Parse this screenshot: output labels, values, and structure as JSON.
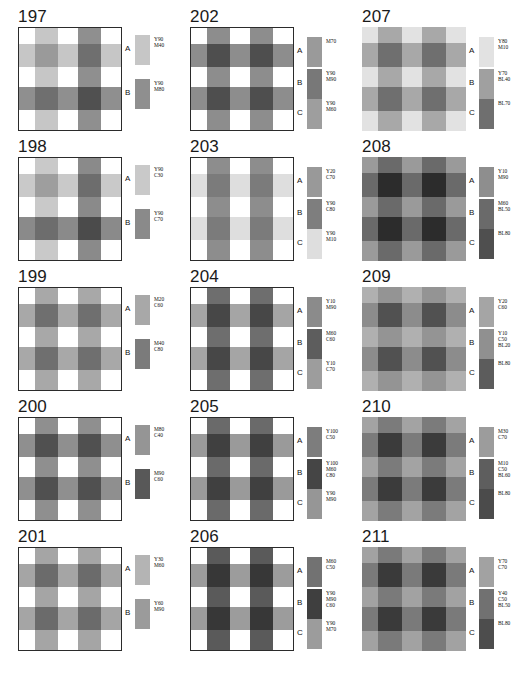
{
  "sheet": {
    "title": "Gingham / check fabric colour pattern plates 197-211",
    "columns": 3,
    "rows": 5
  },
  "plates": [
    {
      "number": "197",
      "bordered": true,
      "axis_labels": [
        "A",
        "B"
      ],
      "legend": [
        {
          "key": "A",
          "color": "#c6c6c6",
          "lines": [
            "Y90",
            "M40"
          ]
        },
        {
          "key": "B",
          "color": "#8f8f8f",
          "lines": [
            "Y90",
            "M80"
          ]
        }
      ],
      "base": "#ffffff",
      "stripes": [
        "#ffffff",
        "#c6c6c6",
        "#ffffff",
        "#8f8f8f",
        "#ffffff"
      ],
      "bands": [
        "#ffffff",
        "#c6c6c6",
        "#ffffff",
        "#8f8f8f",
        "#ffffff"
      ]
    },
    {
      "number": "202",
      "bordered": true,
      "axis_labels": [
        "A",
        "B",
        "C"
      ],
      "legend": [
        {
          "key": "A",
          "color": "#9a9a9a",
          "lines": [
            "M70"
          ]
        },
        {
          "key": "B",
          "color": "#787878",
          "lines": [
            "Y90",
            "M90"
          ]
        },
        {
          "key": "C",
          "color": "#9e9e9e",
          "lines": [
            "Y90",
            "M60"
          ]
        }
      ],
      "base": "#ffffff",
      "stripes": [
        "#ffffff",
        "#8d8d8d",
        "#ffffff",
        "#8d8d8d",
        "#ffffff"
      ],
      "bands": [
        "#ffffff",
        "#8d8d8d",
        "#ffffff",
        "#8d8d8d",
        "#ffffff"
      ]
    },
    {
      "number": "207",
      "bordered": false,
      "axis_labels": [
        "A",
        "B",
        "C"
      ],
      "legend": [
        {
          "key": "A",
          "color": "#e2e2e2",
          "lines": [
            "Y80",
            "M10"
          ]
        },
        {
          "key": "B",
          "color": "#a0a0a0",
          "lines": [
            "Y70",
            "BL40"
          ]
        },
        {
          "key": "C",
          "color": "#6f6f6f",
          "lines": [
            "BL70"
          ]
        }
      ],
      "base": "#e2e2e2",
      "stripes": [
        "#e2e2e2",
        "#a8a8a8",
        "#e2e2e2",
        "#a8a8a8",
        "#e2e2e2"
      ],
      "bands": [
        "#e2e2e2",
        "#a8a8a8",
        "#e2e2e2",
        "#a8a8a8",
        "#e2e2e2"
      ]
    },
    {
      "number": "198",
      "bordered": true,
      "axis_labels": [
        "A",
        "B"
      ],
      "legend": [
        {
          "key": "A",
          "color": "#c9c9c9",
          "lines": [
            "Y90",
            "C30"
          ]
        },
        {
          "key": "B",
          "color": "#8a8a8a",
          "lines": [
            "Y90",
            "C70"
          ]
        }
      ],
      "base": "#ffffff",
      "stripes": [
        "#ffffff",
        "#c9c9c9",
        "#ffffff",
        "#8a8a8a",
        "#ffffff"
      ],
      "bands": [
        "#ffffff",
        "#c9c9c9",
        "#ffffff",
        "#8a8a8a",
        "#ffffff"
      ]
    },
    {
      "number": "203",
      "bordered": true,
      "axis_labels": [
        "A",
        "B",
        "C"
      ],
      "legend": [
        {
          "key": "A",
          "color": "#999999",
          "lines": [
            "Y20",
            "C70"
          ]
        },
        {
          "key": "B",
          "color": "#7e7e7e",
          "lines": [
            "Y90",
            "C80"
          ]
        },
        {
          "key": "C",
          "color": "#dedede",
          "lines": [
            "Y90",
            "M10"
          ]
        }
      ],
      "base": "#ffffff",
      "stripes": [
        "#ffffff",
        "#8d8d8d",
        "#ffffff",
        "#8d8d8d",
        "#ffffff"
      ],
      "bands": [
        "#ffffff",
        "#dedede",
        "#ffffff",
        "#dedede",
        "#ffffff"
      ]
    },
    {
      "number": "208",
      "bordered": false,
      "axis_labels": [
        "A",
        "B",
        "C"
      ],
      "legend": [
        {
          "key": "A",
          "color": "#8e8e8e",
          "lines": [
            "Y10",
            "M90"
          ]
        },
        {
          "key": "B",
          "color": "#6a6a6a",
          "lines": [
            "M60",
            "BL50"
          ]
        },
        {
          "key": "C",
          "color": "#4f4f4f",
          "lines": [
            "BL80"
          ]
        }
      ],
      "base": "#9a9a9a",
      "stripes": [
        "#9a9a9a",
        "#6a6a6a",
        "#9a9a9a",
        "#6a6a6a",
        "#9a9a9a"
      ],
      "bands": [
        "#9a9a9a",
        "#6a6a6a",
        "#9a9a9a",
        "#6a6a6a",
        "#9a9a9a"
      ]
    },
    {
      "number": "199",
      "bordered": true,
      "axis_labels": [
        "A",
        "B"
      ],
      "legend": [
        {
          "key": "A",
          "color": "#a8a8a8",
          "lines": [
            "M20",
            "C60"
          ]
        },
        {
          "key": "B",
          "color": "#7b7b7b",
          "lines": [
            "M40",
            "C80"
          ]
        }
      ],
      "base": "#ffffff",
      "stripes": [
        "#ffffff",
        "#a8a8a8",
        "#ffffff",
        "#a8a8a8",
        "#ffffff"
      ],
      "bands": [
        "#ffffff",
        "#a8a8a8",
        "#ffffff",
        "#a8a8a8",
        "#ffffff"
      ]
    },
    {
      "number": "204",
      "bordered": true,
      "axis_labels": [
        "A",
        "B",
        "C"
      ],
      "legend": [
        {
          "key": "A",
          "color": "#8b8b8b",
          "lines": [
            "Y10",
            "M90"
          ]
        },
        {
          "key": "B",
          "color": "#5d5d5d",
          "lines": [
            "M60",
            "C60"
          ]
        },
        {
          "key": "C",
          "color": "#9d9d9d",
          "lines": [
            "Y10",
            "C70"
          ]
        }
      ],
      "base": "#ffffff",
      "stripes": [
        "#ffffff",
        "#6e6e6e",
        "#ffffff",
        "#6e6e6e",
        "#ffffff"
      ],
      "bands": [
        "#ffffff",
        "#a5a5a5",
        "#ffffff",
        "#a5a5a5",
        "#ffffff"
      ]
    },
    {
      "number": "209",
      "bordered": false,
      "axis_labels": [
        "A",
        "B",
        "C"
      ],
      "legend": [
        {
          "key": "A",
          "color": "#a5a5a5",
          "lines": [
            "Y20",
            "C60"
          ]
        },
        {
          "key": "B",
          "color": "#909090",
          "lines": [
            "Y10",
            "C50",
            "BL20"
          ]
        },
        {
          "key": "C",
          "color": "#5c5c5c",
          "lines": [
            "BL80"
          ]
        }
      ],
      "base": "#b0b0b0",
      "stripes": [
        "#b0b0b0",
        "#949494",
        "#b0b0b0",
        "#949494",
        "#b0b0b0"
      ],
      "bands": [
        "#b0b0b0",
        "#8c8c8c",
        "#b0b0b0",
        "#8c8c8c",
        "#b0b0b0"
      ]
    },
    {
      "number": "200",
      "bordered": true,
      "axis_labels": [
        "A",
        "B"
      ],
      "legend": [
        {
          "key": "A",
          "color": "#959595",
          "lines": [
            "M80",
            "C40"
          ]
        },
        {
          "key": "B",
          "color": "#585858",
          "lines": [
            "M90",
            "C60"
          ]
        }
      ],
      "base": "#ffffff",
      "stripes": [
        "#ffffff",
        "#8f8f8f",
        "#ffffff",
        "#8f8f8f",
        "#ffffff"
      ],
      "bands": [
        "#ffffff",
        "#8f8f8f",
        "#ffffff",
        "#8f8f8f",
        "#ffffff"
      ]
    },
    {
      "number": "205",
      "bordered": true,
      "axis_labels": [
        "A",
        "B",
        "C"
      ],
      "legend": [
        {
          "key": "A",
          "color": "#7d7d7d",
          "lines": [
            "Y100",
            "C50"
          ]
        },
        {
          "key": "B",
          "color": "#454545",
          "lines": [
            "Y100",
            "M60",
            "C80"
          ]
        },
        {
          "key": "C",
          "color": "#969696",
          "lines": [
            "Y90",
            "M90"
          ]
        }
      ],
      "base": "#ffffff",
      "stripes": [
        "#ffffff",
        "#6a6a6a",
        "#ffffff",
        "#6a6a6a",
        "#ffffff"
      ],
      "bands": [
        "#ffffff",
        "#9a9a9a",
        "#ffffff",
        "#9a9a9a",
        "#ffffff"
      ]
    },
    {
      "number": "210",
      "bordered": false,
      "axis_labels": [
        "A",
        "B",
        "C"
      ],
      "legend": [
        {
          "key": "A",
          "color": "#9c9c9c",
          "lines": [
            "M30",
            "C70"
          ]
        },
        {
          "key": "B",
          "color": "#5e5e5e",
          "lines": [
            "M10",
            "C50",
            "BL60"
          ]
        },
        {
          "key": "C",
          "color": "#4b4b4b",
          "lines": [
            "BL80"
          ]
        }
      ],
      "base": "#a3a3a3",
      "stripes": [
        "#a3a3a3",
        "#7b7b7b",
        "#a3a3a3",
        "#7b7b7b",
        "#a3a3a3"
      ],
      "bands": [
        "#a3a3a3",
        "#7b7b7b",
        "#a3a3a3",
        "#7b7b7b",
        "#a3a3a3"
      ]
    },
    {
      "number": "201",
      "bordered": true,
      "axis_labels": [
        "A",
        "B"
      ],
      "legend": [
        {
          "key": "A",
          "color": "#b4b4b4",
          "lines": [
            "Y30",
            "M60"
          ]
        },
        {
          "key": "B",
          "color": "#9b9b9b",
          "lines": [
            "Y60",
            "M90"
          ]
        }
      ],
      "base": "#ffffff",
      "stripes": [
        "#ffffff",
        "#a5a5a5",
        "#ffffff",
        "#a5a5a5",
        "#ffffff"
      ],
      "bands": [
        "#ffffff",
        "#a5a5a5",
        "#ffffff",
        "#a5a5a5",
        "#ffffff"
      ]
    },
    {
      "number": "206",
      "bordered": true,
      "axis_labels": [
        "A",
        "B",
        "C"
      ],
      "legend": [
        {
          "key": "A",
          "color": "#727272",
          "lines": [
            "M60",
            "C50"
          ]
        },
        {
          "key": "B",
          "color": "#3f3f3f",
          "lines": [
            "Y90",
            "M90",
            "C60"
          ]
        },
        {
          "key": "C",
          "color": "#9c9c9c",
          "lines": [
            "Y90",
            "M70"
          ]
        }
      ],
      "base": "#ffffff",
      "stripes": [
        "#ffffff",
        "#5a5a5a",
        "#ffffff",
        "#5a5a5a",
        "#ffffff"
      ],
      "bands": [
        "#ffffff",
        "#9c9c9c",
        "#ffffff",
        "#9c9c9c",
        "#ffffff"
      ]
    },
    {
      "number": "211",
      "bordered": false,
      "axis_labels": [
        "A",
        "B",
        "C"
      ],
      "legend": [
        {
          "key": "A",
          "color": "#a2a2a2",
          "lines": [
            "Y70",
            "C70"
          ]
        },
        {
          "key": "B",
          "color": "#717171",
          "lines": [
            "Y40",
            "C50",
            "BL50"
          ]
        },
        {
          "key": "C",
          "color": "#4d4d4d",
          "lines": [
            "BL80"
          ]
        }
      ],
      "base": "#a2a2a2",
      "stripes": [
        "#a2a2a2",
        "#7a7a7a",
        "#a2a2a2",
        "#7a7a7a",
        "#a2a2a2"
      ],
      "bands": [
        "#a2a2a2",
        "#7a7a7a",
        "#a2a2a2",
        "#7a7a7a",
        "#a2a2a2"
      ]
    }
  ]
}
